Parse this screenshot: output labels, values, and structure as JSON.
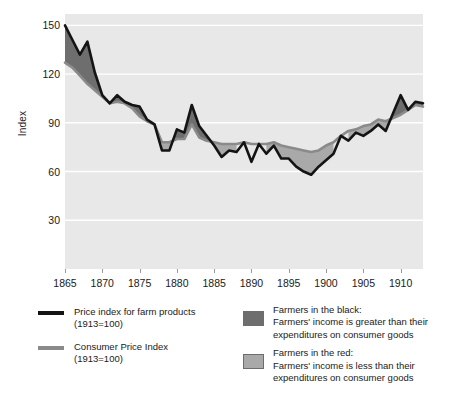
{
  "chart_data": {
    "type": "area",
    "title": "",
    "subtitle": "",
    "xlabel": "",
    "ylabel": "Index",
    "xlim": [
      1865,
      1913
    ],
    "ylim": [
      0,
      157
    ],
    "grid": true,
    "grid_axis": "y",
    "legend_position": "bottom",
    "x_ticks": [
      "1865",
      "1870",
      "1875",
      "1880",
      "1885",
      "1890",
      "1895",
      "1900",
      "1905",
      "1910"
    ],
    "x_tick_values": [
      1865,
      1870,
      1875,
      1880,
      1885,
      1890,
      1895,
      1900,
      1905,
      1910
    ],
    "y_ticks": [
      "30",
      "60",
      "90",
      "120",
      "150"
    ],
    "y_tick_values": [
      30,
      60,
      90,
      120,
      150
    ],
    "x": [
      1865,
      1866,
      1867,
      1868,
      1869,
      1870,
      1871,
      1872,
      1873,
      1874,
      1875,
      1876,
      1877,
      1878,
      1879,
      1880,
      1881,
      1882,
      1883,
      1884,
      1885,
      1886,
      1887,
      1888,
      1889,
      1890,
      1891,
      1892,
      1893,
      1894,
      1895,
      1896,
      1897,
      1898,
      1899,
      1900,
      1901,
      1902,
      1903,
      1904,
      1905,
      1906,
      1907,
      1908,
      1909,
      1910,
      1911,
      1912,
      1913
    ],
    "series": [
      {
        "name": "Price index for farm products (1913=100)",
        "color": "#141414",
        "fill_above_color": "#6e6e6e",
        "values": [
          150,
          141,
          132,
          140,
          121,
          107,
          102,
          107,
          103,
          101,
          100,
          92,
          89,
          73,
          73,
          86,
          84,
          101,
          88,
          82,
          76,
          69,
          73,
          72,
          78,
          66,
          77,
          71,
          76,
          68,
          68,
          63,
          60,
          58,
          63,
          67,
          71,
          82,
          79,
          84,
          82,
          85,
          89,
          85,
          96,
          107,
          98,
          103,
          102
        ]
      },
      {
        "name": "Consumer Price Index (1913=100)",
        "color": "#8a8a8a",
        "values": [
          127,
          124,
          119,
          114,
          110,
          106,
          102,
          103,
          102,
          99,
          94,
          91,
          89,
          78,
          78,
          80,
          80,
          89,
          81,
          79,
          78,
          77,
          77,
          77,
          78,
          77,
          77,
          77,
          78,
          76,
          75,
          74,
          73,
          72,
          73,
          76,
          78,
          82,
          85,
          86,
          88,
          89,
          92,
          91,
          93,
          95,
          98,
          101,
          100
        ]
      }
    ],
    "annotations": []
  },
  "axis": {
    "y_title": "Index"
  },
  "legend": {
    "series": [
      {
        "marker": "dark-line-swatch",
        "line1": "Price index for farm products",
        "line2": "(1913=100)"
      },
      {
        "marker": "gray-line-swatch",
        "line1": "Consumer Price Index",
        "line2": "(1913=100)"
      }
    ],
    "areas": [
      {
        "marker": "dark-area-swatch",
        "line1": "Farmers in the black:",
        "line2": "Farmers' income is greater than their",
        "line3": "expenditures on consumer goods"
      },
      {
        "marker": "light-area-swatch",
        "line1": "Farmers in the red:",
        "line2": "Farmers' income is less than their",
        "line3": "expenditures on consumer goods"
      }
    ]
  },
  "colors": {
    "farm_line": "#141414",
    "cpi_line": "#8a8a8a",
    "black_area": "#6e6e6e",
    "red_area": "#a9a9a9",
    "plot_background": "#e8e8e8",
    "gridline": "#ffffff"
  }
}
